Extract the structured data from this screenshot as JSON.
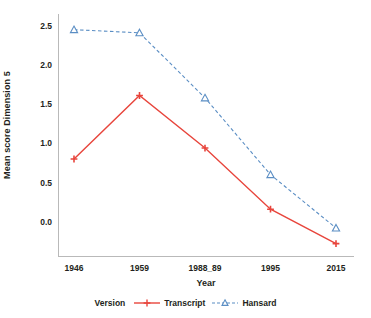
{
  "chart_data": {
    "type": "line",
    "title": "",
    "xlabel": "Year",
    "ylabel": "Mean score Dimension 5",
    "categories": [
      "1946",
      "1959",
      "1988_89",
      "1995",
      "2015"
    ],
    "yticks": [
      "2.5",
      "2.0",
      "1.5",
      "1.0",
      "0.5",
      "0.0"
    ],
    "ytick_values": [
      2.5,
      2.0,
      1.5,
      1.0,
      0.5,
      0.0
    ],
    "ylim": [
      -0.45,
      2.65
    ],
    "grid": false,
    "legend_position": "bottom",
    "legend_title": "Version",
    "series": [
      {
        "name": "Transcript",
        "values": [
          0.8,
          1.61,
          0.94,
          0.16,
          -0.28
        ],
        "color": "#e8453c",
        "linestyle": "solid",
        "marker": "plus"
      },
      {
        "name": "Hansard",
        "values": [
          2.45,
          2.41,
          1.58,
          0.6,
          -0.08
        ],
        "color": "#5b8ec4",
        "linestyle": "dashed",
        "marker": "triangle"
      }
    ]
  },
  "colors": {
    "transcript": "#e8453c",
    "hansard": "#5b8ec4",
    "axis": "#b9b9b9",
    "text": "#231f20",
    "background": "#ffffff"
  }
}
